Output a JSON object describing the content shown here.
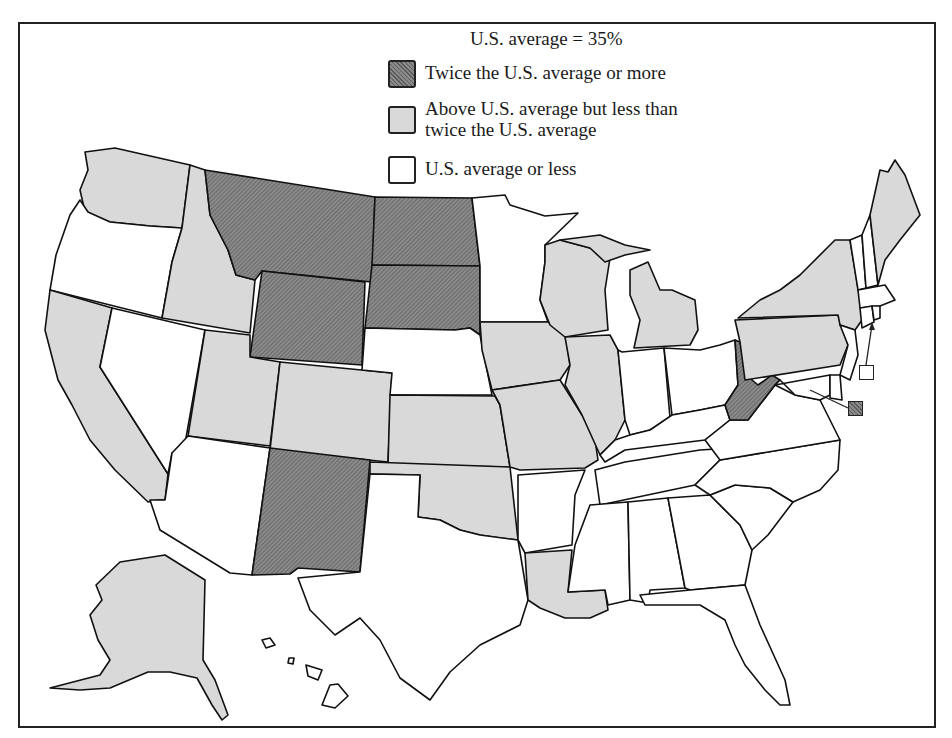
{
  "legend": {
    "title": "U.S. average = 35%",
    "items": [
      {
        "key": "high",
        "label": "Twice the U.S. average or more",
        "fill": "#7a7a7a"
      },
      {
        "key": "mid",
        "label": "Above U.S. average but less than\ntwice the U.S. average",
        "fill": "#d9d9d9"
      },
      {
        "key": "low",
        "label": "U.S. average or less",
        "fill": "#ffffff"
      }
    ]
  },
  "colors": {
    "high": "#7a7a7a",
    "mid": "#d9d9d9",
    "low": "#ffffff",
    "border": "#111111"
  },
  "states": {
    "high": [
      "Montana",
      "North Dakota",
      "South Dakota",
      "Wyoming",
      "New Mexico",
      "West Virginia",
      "District of Columbia"
    ],
    "mid": [
      "Washington",
      "Idaho",
      "California",
      "Utah",
      "Colorado",
      "Kansas",
      "Oklahoma",
      "Iowa",
      "Missouri",
      "Illinois",
      "Wisconsin",
      "Michigan",
      "Louisiana",
      "New York",
      "Pennsylvania",
      "Maine",
      "Alaska"
    ],
    "low": [
      "Oregon",
      "Nevada",
      "Arizona",
      "Texas",
      "Nebraska",
      "Minnesota",
      "Arkansas",
      "Mississippi",
      "Alabama",
      "Georgia",
      "Florida",
      "South Carolina",
      "North Carolina",
      "Tennessee",
      "Kentucky",
      "Virginia",
      "Indiana",
      "Ohio",
      "Maryland",
      "Delaware",
      "New Jersey",
      "Connecticut",
      "Rhode Island",
      "Massachusetts",
      "Vermont",
      "New Hampshire",
      "Hawaii"
    ]
  },
  "callouts": [
    {
      "target": "Rhode Island",
      "category": "low"
    },
    {
      "target": "District of Columbia",
      "category": "high"
    }
  ]
}
